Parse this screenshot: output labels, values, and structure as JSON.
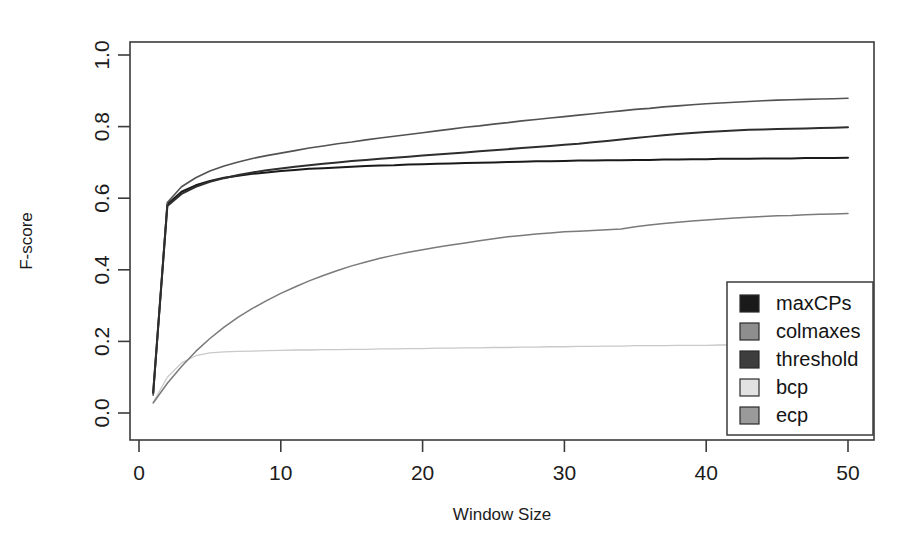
{
  "chart_data": {
    "type": "line",
    "title": "",
    "xlabel": "Window Size",
    "ylabel": "F-score",
    "xlim": [
      0,
      51
    ],
    "ylim": [
      0.0,
      1.05
    ],
    "xticks": [
      0,
      10,
      20,
      30,
      40,
      50
    ],
    "xtick_labels": [
      "0",
      "10",
      "20",
      "30",
      "40",
      "50"
    ],
    "yticks": [
      0.0,
      0.2,
      0.4,
      0.6,
      0.8,
      1.0
    ],
    "ytick_labels": [
      "0.0",
      "0.2",
      "0.4",
      "0.6",
      "0.8",
      "1.0"
    ],
    "grid": false,
    "legend_position": "bottom-right",
    "x": [
      1,
      2,
      3,
      4,
      5,
      6,
      7,
      8,
      9,
      10,
      11,
      12,
      13,
      14,
      15,
      16,
      17,
      18,
      19,
      20,
      21,
      22,
      23,
      24,
      25,
      26,
      27,
      28,
      29,
      30,
      31,
      32,
      33,
      34,
      35,
      36,
      37,
      38,
      39,
      40,
      41,
      42,
      43,
      44,
      45,
      46,
      47,
      48,
      49,
      50
    ],
    "series": [
      {
        "name": "maxCPs",
        "color": "#1a1a1a",
        "width": 2.0,
        "values": [
          0.055,
          0.583,
          0.618,
          0.636,
          0.648,
          0.657,
          0.663,
          0.668,
          0.672,
          0.676,
          0.679,
          0.682,
          0.684,
          0.686,
          0.688,
          0.69,
          0.691,
          0.692,
          0.694,
          0.695,
          0.696,
          0.697,
          0.698,
          0.699,
          0.7,
          0.701,
          0.702,
          0.703,
          0.703,
          0.704,
          0.705,
          0.705,
          0.706,
          0.706,
          0.707,
          0.707,
          0.708,
          0.708,
          0.709,
          0.709,
          0.71,
          0.71,
          0.71,
          0.711,
          0.711,
          0.711,
          0.712,
          0.712,
          0.712,
          0.713
        ]
      },
      {
        "name": "colmaxes",
        "color": "#525252",
        "width": 1.6,
        "values": [
          0.05,
          0.588,
          0.632,
          0.657,
          0.676,
          0.69,
          0.701,
          0.711,
          0.719,
          0.726,
          0.733,
          0.74,
          0.746,
          0.752,
          0.757,
          0.763,
          0.768,
          0.773,
          0.778,
          0.783,
          0.788,
          0.793,
          0.798,
          0.802,
          0.807,
          0.811,
          0.816,
          0.82,
          0.824,
          0.828,
          0.832,
          0.836,
          0.84,
          0.844,
          0.848,
          0.851,
          0.855,
          0.858,
          0.861,
          0.864,
          0.866,
          0.868,
          0.87,
          0.872,
          0.874,
          0.875,
          0.876,
          0.877,
          0.878,
          0.879
        ]
      },
      {
        "name": "threshold",
        "color": "#2e2e2e",
        "width": 2.0,
        "values": [
          0.058,
          0.578,
          0.612,
          0.632,
          0.646,
          0.656,
          0.665,
          0.672,
          0.678,
          0.683,
          0.688,
          0.692,
          0.696,
          0.7,
          0.704,
          0.707,
          0.71,
          0.713,
          0.716,
          0.719,
          0.722,
          0.725,
          0.728,
          0.731,
          0.734,
          0.737,
          0.74,
          0.743,
          0.746,
          0.749,
          0.752,
          0.756,
          0.76,
          0.764,
          0.768,
          0.772,
          0.776,
          0.779,
          0.782,
          0.785,
          0.787,
          0.789,
          0.791,
          0.792,
          0.793,
          0.794,
          0.795,
          0.796,
          0.797,
          0.798
        ]
      },
      {
        "name": "bcp",
        "color": "#c9c9c9",
        "width": 1.3,
        "values": [
          0.03,
          0.1,
          0.14,
          0.16,
          0.168,
          0.171,
          0.172,
          0.173,
          0.174,
          0.175,
          0.176,
          0.176,
          0.177,
          0.177,
          0.178,
          0.178,
          0.179,
          0.179,
          0.18,
          0.18,
          0.181,
          0.181,
          0.182,
          0.182,
          0.183,
          0.183,
          0.184,
          0.184,
          0.185,
          0.185,
          0.186,
          0.186,
          0.187,
          0.187,
          0.188,
          0.188,
          0.188,
          0.189,
          0.189,
          0.189,
          0.19,
          0.19,
          0.19,
          0.191,
          0.191,
          0.191,
          0.192,
          0.192,
          0.192,
          0.193
        ]
      },
      {
        "name": "ecp",
        "color": "#7a7a7a",
        "width": 1.5,
        "values": [
          0.028,
          0.083,
          0.13,
          0.172,
          0.208,
          0.24,
          0.268,
          0.292,
          0.314,
          0.334,
          0.352,
          0.369,
          0.384,
          0.398,
          0.411,
          0.422,
          0.432,
          0.441,
          0.449,
          0.456,
          0.463,
          0.469,
          0.475,
          0.481,
          0.487,
          0.492,
          0.496,
          0.5,
          0.503,
          0.506,
          0.508,
          0.51,
          0.512,
          0.514,
          0.52,
          0.525,
          0.529,
          0.533,
          0.536,
          0.539,
          0.542,
          0.545,
          0.547,
          0.549,
          0.551,
          0.552,
          0.554,
          0.555,
          0.556,
          0.557
        ]
      }
    ]
  },
  "legend": {
    "entries": [
      {
        "label": "maxCPs",
        "color": "#1a1a1a"
      },
      {
        "label": "colmaxes",
        "color": "#8e8e8e"
      },
      {
        "label": "threshold",
        "color": "#3d3d3d"
      },
      {
        "label": "bcp",
        "color": "#e2e2e2"
      },
      {
        "label": "ecp",
        "color": "#9a9a9a"
      }
    ]
  }
}
